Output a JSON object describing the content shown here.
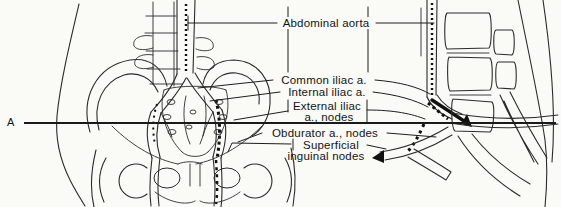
{
  "colors": {
    "paper": "#fafaf6",
    "ink": "#2b2b2b",
    "text": "#141414"
  },
  "section_marker": "A",
  "labels": {
    "abdominal_aorta": "Abdominal aorta",
    "common_iliac": "Common iliac a.",
    "internal_iliac": "Internal iliac a.",
    "external_iliac_line1": "External iliac",
    "external_iliac_line2": "a., nodes",
    "obdurator": "Obdurator a., nodes",
    "superficial_line1": "Superficial",
    "superficial_line2": "inguinal nodes"
  }
}
